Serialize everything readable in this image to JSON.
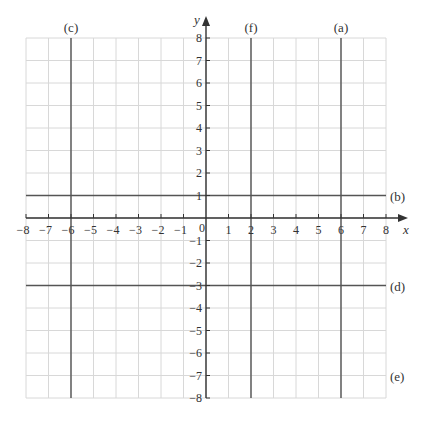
{
  "chart_data": {
    "type": "line",
    "title": "",
    "xlabel": "x",
    "ylabel": "y",
    "xlim": [
      -8,
      8
    ],
    "ylim": [
      -8,
      8
    ],
    "grid": true,
    "x_ticks": [
      -8,
      -7,
      -6,
      -5,
      -4,
      -3,
      -2,
      -1,
      0,
      1,
      2,
      3,
      4,
      5,
      6,
      7,
      8
    ],
    "y_ticks": [
      -8,
      -7,
      -6,
      -5,
      -4,
      -3,
      -2,
      -1,
      1,
      2,
      3,
      4,
      5,
      6,
      7,
      8
    ],
    "origin_label": "0",
    "series": [
      {
        "name": "(a)",
        "orientation": "vertical",
        "equation": "x = 6",
        "value": 6
      },
      {
        "name": "(b)",
        "orientation": "horizontal",
        "equation": "y = 1",
        "value": 1
      },
      {
        "name": "(c)",
        "orientation": "vertical",
        "equation": "x = -6",
        "value": -6
      },
      {
        "name": "(d)",
        "orientation": "horizontal",
        "equation": "y = -3",
        "value": -3
      },
      {
        "name": "(e)",
        "orientation": "horizontal",
        "equation": "y = -7",
        "value": -7
      },
      {
        "name": "(f)",
        "orientation": "vertical",
        "equation": "x = 2",
        "value": 2
      }
    ]
  },
  "labels": {
    "x_axis": "x",
    "y_axis": "y",
    "origin": "0",
    "a": "(a)",
    "b": "(b)",
    "c": "(c)",
    "d": "(d)",
    "e": "(e)",
    "f": "(f)"
  },
  "colors": {
    "grid": "#d8d8d8",
    "axis": "#333333",
    "line": "#555555"
  }
}
